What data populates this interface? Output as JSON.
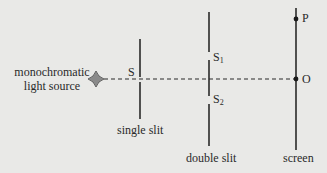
{
  "diagram": {
    "source_label_line1": "monochromatic",
    "source_label_line2": "light source",
    "single_slit_label": "single slit",
    "single_slit_point": "S",
    "double_slit_label": "double slit",
    "slit1_letter": "S",
    "slit1_sub": "1",
    "slit2_letter": "S",
    "slit2_sub": "2",
    "screen_label": "screen",
    "point_P": "P",
    "point_O": "O",
    "colors": {
      "background": "#e9e9e7",
      "lines": "#2a2a2a",
      "source_fill": "#8a8a8a"
    }
  }
}
